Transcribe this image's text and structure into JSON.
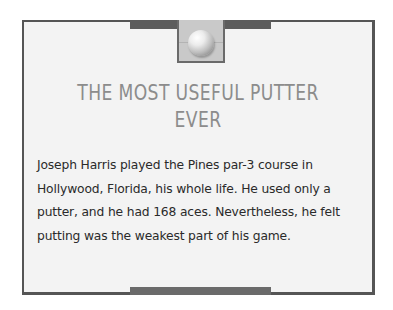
{
  "card": {
    "title_lines": [
      "THE MOST USEFUL PUTTER",
      "EVER"
    ],
    "body_lines": [
      "Joseph Harris played the Pines par-3 course in",
      "Hollywood, Florida, his whole life. He used only a",
      "putter, and he had 168 aces. Nevertheless, he felt",
      "putting was the weakest part of his game."
    ],
    "emblem_icon": "golf-ball-icon"
  },
  "colors": {
    "border": "#555555",
    "card_background": "#f3f3f3",
    "title": "#8c8c8c",
    "body_text": "#2a2a2a",
    "bar": "#5c5c5c"
  }
}
